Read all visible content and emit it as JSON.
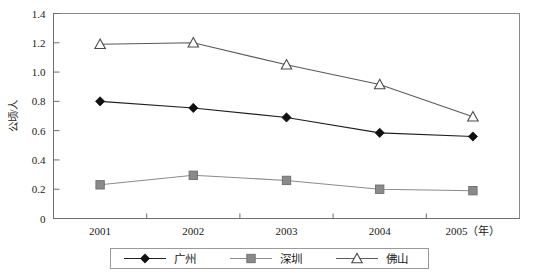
{
  "chart_data": {
    "type": "line",
    "title": "",
    "subtitle": "",
    "xlabel": "2005（年）",
    "ylabel": "公顷/人",
    "x_axis_unit_note": "（年）",
    "categories": [
      "2001",
      "2002",
      "2003",
      "2004",
      "2005"
    ],
    "x": [
      2001,
      2002,
      2003,
      2004,
      2005
    ],
    "xlim": [
      2001,
      2005
    ],
    "ylim": [
      0,
      1.4
    ],
    "y_ticks": [
      "0",
      "0.2",
      "0.4",
      "0.6",
      "0.8",
      "1.0",
      "1.2",
      "1.4"
    ],
    "y_tick_values": [
      0,
      0.2,
      0.4,
      0.6,
      0.8,
      1.0,
      1.2,
      1.4
    ],
    "grid": false,
    "legend_position": "bottom",
    "series": [
      {
        "name": "广州",
        "marker": "diamond",
        "color": "#111111",
        "values": [
          0.8,
          0.755,
          0.69,
          0.585,
          0.56
        ]
      },
      {
        "name": "深圳",
        "marker": "square",
        "color": "#8a8a8a",
        "values": [
          0.23,
          0.295,
          0.26,
          0.2,
          0.19
        ]
      },
      {
        "name": "佛山",
        "marker": "triangle",
        "color": "#4a4a4a",
        "values": [
          1.19,
          1.2,
          1.05,
          0.915,
          0.695
        ]
      }
    ]
  },
  "legend": {
    "items": [
      {
        "label": "广州",
        "marker": "diamond-marker-icon"
      },
      {
        "label": "深圳",
        "marker": "square-marker-icon"
      },
      {
        "label": "佛山",
        "marker": "triangle-marker-icon"
      }
    ]
  },
  "axes": {
    "y_title": "公顷/人",
    "y_tick_labels": [
      "1.4",
      "1.2",
      "1.0",
      "0.8",
      "0.6",
      "0.4",
      "0.2",
      "0"
    ],
    "x_tick_labels": [
      "2001",
      "2002",
      "2003",
      "2004",
      "2005（年）"
    ]
  }
}
